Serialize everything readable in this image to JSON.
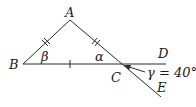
{
  "diagram": {
    "type": "geometry",
    "points": {
      "A": {
        "label": "A",
        "x": 70,
        "y": 20
      },
      "B": {
        "label": "B",
        "x": 23,
        "y": 64
      },
      "C": {
        "label": "C",
        "x": 118,
        "y": 64
      },
      "D": {
        "label": "D",
        "x": 166,
        "y": 64
      },
      "E": {
        "label": "E",
        "x": 161,
        "y": 97
      }
    },
    "angles": {
      "beta": "β",
      "alpha": "α",
      "gamma": "γ = 40°"
    },
    "segments": [
      {
        "from": "A",
        "to": "B",
        "ticks": 2
      },
      {
        "from": "A",
        "to": "C",
        "ticks": 2
      },
      {
        "from": "B",
        "to": "C",
        "ticks": 1
      },
      {
        "from": "C",
        "to": "D",
        "ticks": 0
      },
      {
        "from": "C",
        "to": "E",
        "ticks": 0
      }
    ],
    "colors": {
      "stroke": "#2a2a2a",
      "text": "#1a1a1a",
      "background": "#ffffff"
    }
  }
}
